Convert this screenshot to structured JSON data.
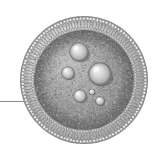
{
  "figure": {
    "subject": "liposome",
    "style": "grayscale-halftone-illustration",
    "background_color": "#ffffff",
    "width": 153,
    "height": 151
  },
  "canvas": {
    "width": 153,
    "height": 151
  },
  "vesicle": {
    "name": "liposome-vesicle",
    "center_x": 84,
    "center_y": 80,
    "outer_radius": 64,
    "membrane_outer_radius": 64,
    "membrane_inner_radius": 50,
    "lumen_radius": 50,
    "membrane_color_light": "#e8e8e8",
    "membrane_color_mid": "#a8a8a8",
    "membrane_color_dark": "#6f6f6f",
    "lumen_color_light": "#bdbdbd",
    "lumen_color_mid": "#a0a0a0",
    "lumen_color_dark": "#868686",
    "outline_color": "#7a7a7a"
  },
  "membrane": {
    "name": "phospholipid-bilayer",
    "lipid_count": 116,
    "lipid_head_radius": 1.5,
    "lipid_tail_length": 9,
    "lipid_head_color": "#f2f2f2",
    "lipid_tail_color": "#8c8c8c",
    "lipid_stroke_color": "#707070",
    "description": "radial lipid spikes forming bilayer shell"
  },
  "particles": {
    "name": "encapsulated-particles",
    "count": 6,
    "highlight_color": "#f4f4f4",
    "body_color": "#b4b4b4",
    "shadow_color": "#6a6a6a",
    "items": [
      {
        "label": "particle-1",
        "cx": 79,
        "cy": 52,
        "r": 9.5
      },
      {
        "label": "particle-2",
        "cx": 100,
        "cy": 74,
        "r": 11.5
      },
      {
        "label": "particle-3",
        "cx": 68,
        "cy": 73,
        "r": 6.5
      },
      {
        "label": "particle-4",
        "cx": 80,
        "cy": 96,
        "r": 6.5
      },
      {
        "label": "particle-5",
        "cx": 100,
        "cy": 101,
        "r": 4.5
      },
      {
        "label": "particle-6",
        "cx": 92,
        "cy": 92,
        "r": 3.0
      }
    ]
  },
  "leader_line": {
    "name": "leader-line",
    "x_start": 0,
    "x_end": 40,
    "y": 101,
    "thickness": 1,
    "color": "#8a8a8a",
    "description": "horizontal pointer entering from left edge toward membrane"
  },
  "grain": {
    "name": "halftone-grain",
    "opacity": 0.3,
    "dot_count": 2600,
    "seed": 20240517
  },
  "accessibility": {
    "caption": "Grayscale cross-section illustration of a liposome showing a radial phospholipid bilayer membrane enclosing an aqueous lumen containing six spherical encapsulated particles, with a leader line pointing at the membrane from the left."
  }
}
